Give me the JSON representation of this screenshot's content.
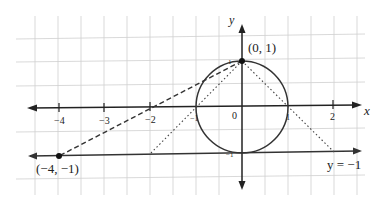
{
  "diagram": {
    "type": "coordinate-plane",
    "axes": {
      "x_label": "x",
      "y_label": "y"
    },
    "x_ticks": [
      {
        "value": -4,
        "label": "−4"
      },
      {
        "value": -3,
        "label": "−3"
      },
      {
        "value": -2,
        "label": "−2"
      },
      {
        "value": -1,
        "label": "−1"
      },
      {
        "value": 0,
        "label": "0"
      },
      {
        "value": 1,
        "label": "1"
      },
      {
        "value": 2,
        "label": "2"
      }
    ],
    "y_ticks": [
      {
        "value": 1,
        "label": "1"
      },
      {
        "value": -1,
        "label": "−1"
      }
    ],
    "circle": {
      "center": [
        0,
        0
      ],
      "radius": 1
    },
    "points": [
      {
        "name": "P",
        "coords": [
          0,
          1
        ],
        "label": "(0, 1)"
      },
      {
        "name": "Q",
        "coords": [
          -4,
          -1
        ],
        "label": "(−4, −1)"
      }
    ],
    "lines": [
      {
        "name": "horizontal-line",
        "equation": "y = −1",
        "label": "y = −1"
      }
    ],
    "dashed_segment": {
      "from": [
        0,
        1
      ],
      "to": [
        -4,
        -1
      ]
    },
    "dotted_segments": [
      {
        "from": [
          0,
          1
        ],
        "to": [
          -2,
          -1
        ]
      },
      {
        "from": [
          0,
          1
        ],
        "to": [
          2,
          -1
        ]
      }
    ],
    "colors": {
      "axis": "#222222",
      "grid": "#c8c8c8",
      "curve": "#333333"
    }
  }
}
